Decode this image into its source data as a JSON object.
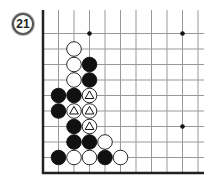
{
  "problem": {
    "number": "21"
  },
  "board": {
    "origin_x": 43,
    "origin_y": 18,
    "spacing": 15.5,
    "cols": 11,
    "rows": 11,
    "edges": [
      "left",
      "bottom"
    ],
    "line_color": "#999999",
    "edge_color": "#222222",
    "star_points": [
      [
        3,
        1
      ],
      [
        9,
        1
      ],
      [
        9,
        7
      ]
    ],
    "stones": [
      {
        "c": 2,
        "r": 2,
        "color": "white"
      },
      {
        "c": 2,
        "r": 3,
        "color": "white"
      },
      {
        "c": 3,
        "r": 3,
        "color": "black"
      },
      {
        "c": 2,
        "r": 4,
        "color": "white"
      },
      {
        "c": 3,
        "r": 4,
        "color": "black"
      },
      {
        "c": 1,
        "r": 5,
        "color": "black"
      },
      {
        "c": 2,
        "r": 5,
        "color": "black"
      },
      {
        "c": 3,
        "r": 5,
        "color": "white",
        "mark": "triangle"
      },
      {
        "c": 1,
        "r": 6,
        "color": "black"
      },
      {
        "c": 2,
        "r": 6,
        "color": "white",
        "mark": "triangle"
      },
      {
        "c": 3,
        "r": 6,
        "color": "white",
        "mark": "triangle"
      },
      {
        "c": 2,
        "r": 7,
        "color": "black"
      },
      {
        "c": 3,
        "r": 7,
        "color": "white",
        "mark": "triangle"
      },
      {
        "c": 2,
        "r": 8,
        "color": "black"
      },
      {
        "c": 3,
        "r": 8,
        "color": "black"
      },
      {
        "c": 4,
        "r": 8,
        "color": "white"
      },
      {
        "c": 1,
        "r": 9,
        "color": "black"
      },
      {
        "c": 2,
        "r": 9,
        "color": "white"
      },
      {
        "c": 3,
        "r": 9,
        "color": "white"
      },
      {
        "c": 4,
        "r": 9,
        "color": "black"
      },
      {
        "c": 5,
        "r": 9,
        "color": "white"
      }
    ]
  }
}
